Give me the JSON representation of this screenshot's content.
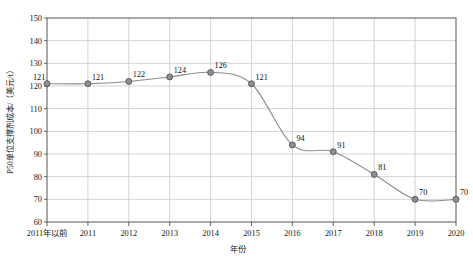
{
  "chart_data": {
    "type": "line",
    "title": "",
    "xlabel": "年份",
    "ylabel": "P50单位支撑剂成本/（美元/t）",
    "categories": [
      "2011年以前",
      "2011",
      "2012",
      "2013",
      "2014",
      "2015",
      "2016",
      "2017",
      "2018",
      "2019",
      "2020"
    ],
    "values": [
      121,
      121,
      122,
      124,
      126,
      121,
      94,
      91,
      81,
      70,
      70
    ],
    "series": [
      {
        "name": "P50单位支撑剂成本",
        "values": [
          121,
          121,
          122,
          124,
          126,
          121,
          94,
          91,
          81,
          70,
          70
        ]
      }
    ],
    "ylim": [
      60,
      150
    ],
    "yticks": [
      60,
      70,
      80,
      90,
      100,
      110,
      120,
      130,
      140,
      150
    ],
    "ytick_labels": [
      "60",
      "70",
      "80",
      "90",
      "100",
      "110",
      "120",
      "130",
      "140",
      "150"
    ],
    "data_labels": [
      "121",
      "121",
      "122",
      "124",
      "126",
      "121",
      "94",
      "91",
      "81",
      "70",
      "70"
    ],
    "grid": true,
    "grid_axis": "both",
    "legend": false,
    "legend_position": "none",
    "smoothing": "spline",
    "marker": "circle",
    "colors": {
      "line": "#8c8c8c",
      "marker_fill": "#8f8f8f",
      "marker_stroke": "#4a4a4a",
      "grid": "#c8c8c8",
      "axis": "#555555",
      "text": "#1a1a1a",
      "background": "#ffffff"
    }
  },
  "figure": {
    "caption": ""
  }
}
